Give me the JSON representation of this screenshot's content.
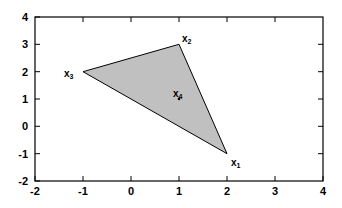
{
  "chart_data": {
    "type": "scatter",
    "title": "",
    "xlabel": "",
    "ylabel": "",
    "xlim": [
      -2,
      4
    ],
    "ylim": [
      -2,
      4
    ],
    "grid": false,
    "legend": null,
    "xticks": [
      -2,
      -1,
      0,
      1,
      2,
      3,
      4
    ],
    "xticklabels": [
      "-2",
      "-1",
      "0",
      "1",
      "2",
      "3",
      "4"
    ],
    "yticks": [
      -2,
      -1,
      0,
      1,
      2,
      3,
      4
    ],
    "yticklabels": [
      "-2",
      "-1",
      "0",
      "1",
      "2",
      "3",
      "4"
    ],
    "fill_color": "#c0c0c0",
    "edge_color": "#000000",
    "axis_color": "#000000",
    "background_color": "#ffffff",
    "polygon": {
      "name": "convex-hull-triangle",
      "vertices": [
        {
          "label": "x1",
          "sub": "1",
          "x": 2,
          "y": -1
        },
        {
          "label": "x2",
          "sub": "2",
          "x": 1,
          "y": 3
        },
        {
          "label": "x3",
          "sub": "3",
          "x": -1,
          "y": 2
        }
      ]
    },
    "points": [
      {
        "label": "x1",
        "base": "x",
        "sub": "1",
        "x": 2,
        "y": -1,
        "marker": "vertex",
        "label_pos": "right-below"
      },
      {
        "label": "x2",
        "base": "x",
        "sub": "2",
        "x": 1,
        "y": 3,
        "marker": "vertex",
        "label_pos": "right-above"
      },
      {
        "label": "x3",
        "base": "x",
        "sub": "3",
        "x": -1,
        "y": 2,
        "marker": "vertex",
        "label_pos": "left"
      },
      {
        "label": "x4",
        "base": "x",
        "sub": "4",
        "x": 1,
        "y": 1,
        "marker": "dot",
        "label_pos": "above"
      }
    ]
  },
  "axis": {
    "x_tick_labels": [
      "-2",
      "-1",
      "0",
      "1",
      "2",
      "3",
      "4"
    ],
    "y_tick_labels": [
      "4",
      "3",
      "2",
      "1",
      "0",
      "-1",
      "-2"
    ]
  },
  "labels": {
    "x1_base": "x",
    "x1_sub": "1",
    "x2_base": "x",
    "x2_sub": "2",
    "x3_base": "x",
    "x3_sub": "3",
    "x4_base": "x",
    "x4_sub": "4"
  }
}
